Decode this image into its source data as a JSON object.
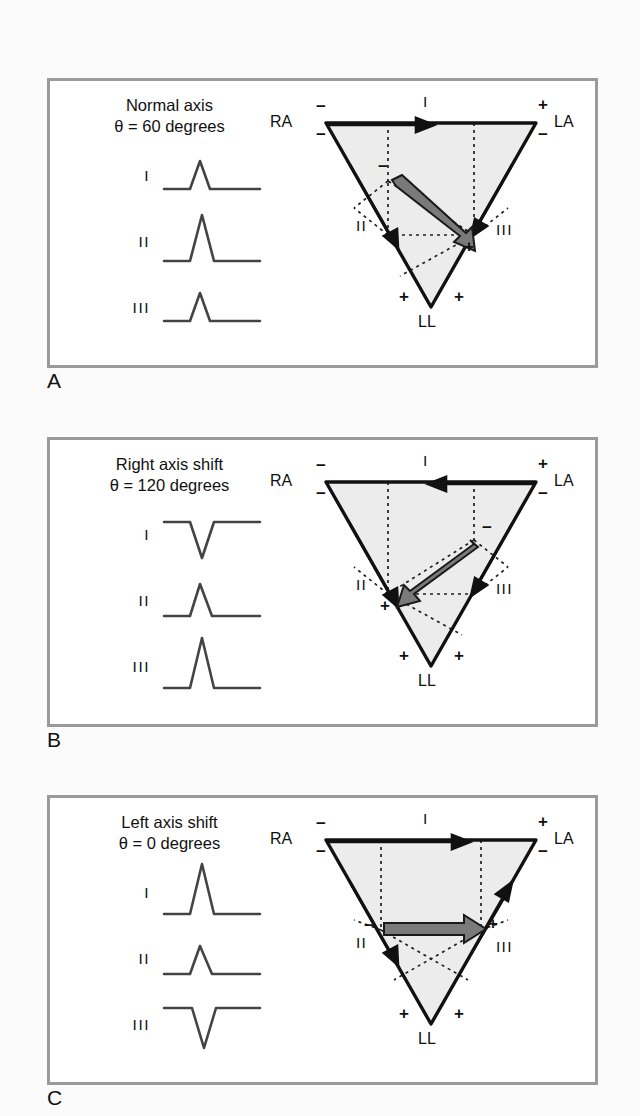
{
  "figure": {
    "colors": {
      "panel_border": "#9a9a9a",
      "triangle_stroke": "#111111",
      "triangle_fill": "#ececec",
      "dotted_line": "#222222",
      "vector_fill": "#7a7a7a",
      "vector_stroke": "#1a1a1a",
      "waveform": "#444444",
      "page_background": "#fbfbfb"
    }
  },
  "panels": [
    {
      "letter": "A",
      "title_line1": "Normal axis",
      "title_line2": "θ = 60 degrees",
      "theta_degrees": 60,
      "leads": [
        {
          "label": "I",
          "deflection": "positive",
          "amplitude": "medium"
        },
        {
          "label": "II",
          "deflection": "positive",
          "amplitude": "large"
        },
        {
          "label": "III",
          "deflection": "positive",
          "amplitude": "medium"
        }
      ],
      "triangle": {
        "vertex_labels": {
          "right_arm": "RA",
          "left_arm": "LA",
          "left_leg": "LL"
        },
        "polarity": {
          "ra_top": "−",
          "ra_bottom": "−",
          "la_top": "+",
          "la_bottom": "−",
          "ll_left": "+",
          "ll_right": "+"
        },
        "lead_labels": {
          "lead1": "I",
          "lead2": "II",
          "lead3": "III"
        },
        "lead_arrow_directions": {
          "lead1": "right",
          "lead2": "down-right",
          "lead3": "down-left"
        },
        "vector": {
          "negative_end_label": "−",
          "positive_end_label": "+",
          "direction": "down-right",
          "angle_degrees": 60
        }
      }
    },
    {
      "letter": "B",
      "title_line1": "Right axis shift",
      "title_line2": "θ = 120 degrees",
      "theta_degrees": 120,
      "leads": [
        {
          "label": "I",
          "deflection": "negative",
          "amplitude": "medium"
        },
        {
          "label": "II",
          "deflection": "positive",
          "amplitude": "medium"
        },
        {
          "label": "III",
          "deflection": "positive",
          "amplitude": "large"
        }
      ],
      "triangle": {
        "vertex_labels": {
          "right_arm": "RA",
          "left_arm": "LA",
          "left_leg": "LL"
        },
        "polarity": {
          "ra_top": "−",
          "ra_bottom": "−",
          "la_top": "+",
          "la_bottom": "−",
          "ll_left": "+",
          "ll_right": "+"
        },
        "lead_labels": {
          "lead1": "I",
          "lead2": "II",
          "lead3": "III"
        },
        "lead_arrow_directions": {
          "lead1": "left",
          "lead2": "down-right",
          "lead3": "down-left"
        },
        "vector": {
          "negative_end_label": "−",
          "positive_end_label": "+",
          "direction": "down-left",
          "angle_degrees": 120
        }
      }
    },
    {
      "letter": "C",
      "title_line1": "Left axis shift",
      "title_line2": "θ = 0 degrees",
      "theta_degrees": 0,
      "leads": [
        {
          "label": "I",
          "deflection": "positive",
          "amplitude": "large"
        },
        {
          "label": "II",
          "deflection": "positive",
          "amplitude": "small"
        },
        {
          "label": "III",
          "deflection": "negative",
          "amplitude": "medium"
        }
      ],
      "triangle": {
        "vertex_labels": {
          "right_arm": "RA",
          "left_arm": "LA",
          "left_leg": "LL"
        },
        "polarity": {
          "ra_top": "−",
          "ra_bottom": "−",
          "la_top": "+",
          "la_bottom": "−",
          "ll_left": "+",
          "ll_right": "+"
        },
        "lead_labels": {
          "lead1": "I",
          "lead2": "II",
          "lead3": "III"
        },
        "lead_arrow_directions": {
          "lead1": "right",
          "lead2": "down-right",
          "lead3": "up-right"
        },
        "vector": {
          "negative_end_label": "−",
          "positive_end_label": "+",
          "direction": "right",
          "angle_degrees": 0
        }
      }
    }
  ]
}
